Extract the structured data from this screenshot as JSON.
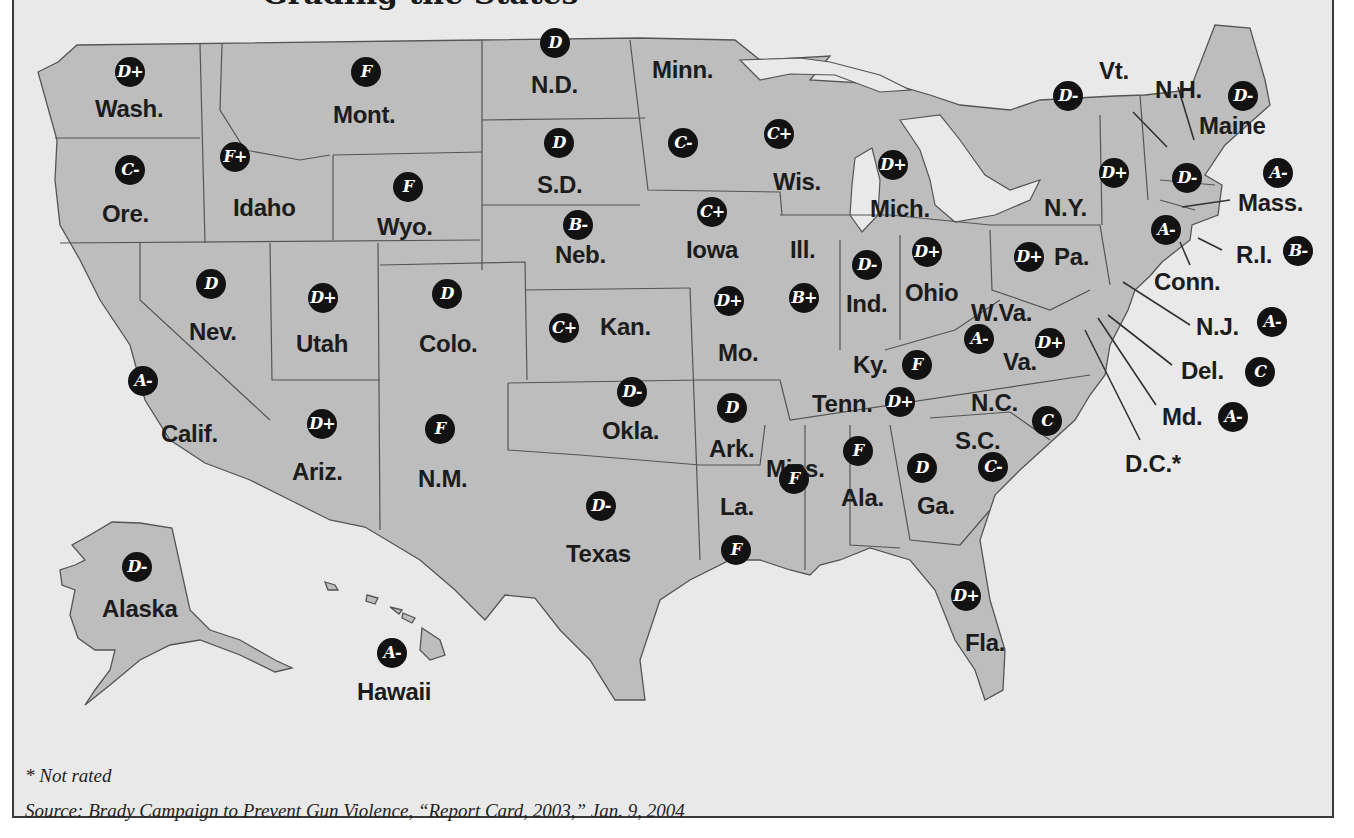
{
  "title": "Grading the States",
  "colors": {
    "background": "#e9e9e9",
    "land": "#bdbdbd",
    "badge": "#121212",
    "badge_text": "#ffffff",
    "border": "#3a3a3a"
  },
  "states": [
    {
      "abbr": "Wash.",
      "grade": "D+",
      "lx": 95,
      "ly": 95,
      "bx": 115,
      "by": 57
    },
    {
      "abbr": "Mont.",
      "grade": "F",
      "lx": 333,
      "ly": 101,
      "bx": 351,
      "by": 57
    },
    {
      "abbr": "N.D.",
      "grade": "D",
      "lx": 531,
      "ly": 71,
      "bx": 540,
      "by": 28
    },
    {
      "abbr": "Minn.",
      "grade": "",
      "lx": 652,
      "ly": 56,
      "bx": 0,
      "by": 0
    },
    {
      "abbr": "Minn. grade",
      "grade": "C-",
      "lx": 0,
      "ly": 0,
      "bx": 668,
      "by": 128
    },
    {
      "abbr": "Ore.",
      "grade": "C-",
      "lx": 102,
      "ly": 200,
      "bx": 115,
      "by": 155
    },
    {
      "abbr": "Idaho",
      "grade": "F+",
      "lx": 233,
      "ly": 194,
      "bx": 220,
      "by": 142
    },
    {
      "abbr": "Wyo.",
      "grade": "F",
      "lx": 377,
      "ly": 213,
      "bx": 393,
      "by": 172
    },
    {
      "abbr": "S.D.",
      "grade": "D",
      "lx": 537,
      "ly": 171,
      "bx": 544,
      "by": 128
    },
    {
      "abbr": "Neb.",
      "grade": "B-",
      "lx": 555,
      "ly": 241,
      "bx": 563,
      "by": 210
    },
    {
      "abbr": "Iowa",
      "grade": "C+",
      "lx": 686,
      "ly": 236,
      "bx": 697,
      "by": 197
    },
    {
      "abbr": "Wis.",
      "grade": "C+",
      "lx": 773,
      "ly": 168,
      "bx": 764,
      "by": 119
    },
    {
      "abbr": "Mich.",
      "grade": "D+",
      "lx": 870,
      "ly": 195,
      "bx": 878,
      "by": 150
    },
    {
      "abbr": "Vt.",
      "grade": "D-",
      "lx": 1099,
      "ly": 57,
      "bx": 1053,
      "by": 81
    },
    {
      "abbr": "N.H.",
      "grade": "D-",
      "lx": 1155,
      "ly": 76,
      "bx": 1172,
      "by": 163
    },
    {
      "abbr": "Maine",
      "grade": "D-",
      "lx": 1199,
      "ly": 112,
      "bx": 1228,
      "by": 81
    },
    {
      "abbr": "Mass.",
      "grade": "A-",
      "lx": 1238,
      "ly": 189,
      "bx": 1263,
      "by": 158
    },
    {
      "abbr": "N.Y.",
      "grade": "D+",
      "lx": 1044,
      "ly": 194,
      "bx": 1099,
      "by": 158
    },
    {
      "abbr": "Conn.",
      "grade": "A-",
      "lx": 1154,
      "ly": 268,
      "bx": 1151,
      "by": 215
    },
    {
      "abbr": "R.I.",
      "grade": "B-",
      "lx": 1236,
      "ly": 241,
      "bx": 1283,
      "by": 236
    },
    {
      "abbr": "Pa.",
      "grade": "D+",
      "lx": 1054,
      "ly": 243,
      "bx": 1014,
      "by": 242
    },
    {
      "abbr": "Ohio",
      "grade": "D+",
      "lx": 905,
      "ly": 279,
      "bx": 912,
      "by": 237
    },
    {
      "abbr": "Ind.",
      "grade": "D-",
      "lx": 846,
      "ly": 290,
      "bx": 852,
      "by": 250
    },
    {
      "abbr": "Ill.",
      "grade": "B+",
      "lx": 790,
      "ly": 236,
      "bx": 789,
      "by": 283
    },
    {
      "abbr": "Nev.",
      "grade": "D",
      "lx": 189,
      "ly": 318,
      "bx": 196,
      "by": 269
    },
    {
      "abbr": "Utah",
      "grade": "D+",
      "lx": 296,
      "ly": 330,
      "bx": 308,
      "by": 283
    },
    {
      "abbr": "Colo.",
      "grade": "D",
      "lx": 419,
      "ly": 330,
      "bx": 432,
      "by": 279
    },
    {
      "abbr": "Kan.",
      "grade": "C+",
      "lx": 600,
      "ly": 313,
      "bx": 549,
      "by": 313
    },
    {
      "abbr": "Mo.",
      "grade": "D+",
      "lx": 718,
      "ly": 339,
      "bx": 714,
      "by": 286
    },
    {
      "abbr": "W.Va.",
      "grade": "A-",
      "lx": 971,
      "ly": 299,
      "bx": 964,
      "by": 324
    },
    {
      "abbr": "Va.",
      "grade": "D+",
      "lx": 1003,
      "ly": 348,
      "bx": 1035,
      "by": 328
    },
    {
      "abbr": "Ky.",
      "grade": "F",
      "lx": 853,
      "ly": 351,
      "bx": 902,
      "by": 350
    },
    {
      "abbr": "N.J.",
      "grade": "A-",
      "lx": 1196,
      "ly": 313,
      "bx": 1257,
      "by": 307
    },
    {
      "abbr": "Del.",
      "grade": "C",
      "lx": 1181,
      "ly": 357,
      "bx": 1245,
      "by": 357
    },
    {
      "abbr": "Md.",
      "grade": "A-",
      "lx": 1162,
      "ly": 403,
      "bx": 1218,
      "by": 402
    },
    {
      "abbr": "D.C.*",
      "grade": "",
      "lx": 1125,
      "ly": 450,
      "bx": 0,
      "by": 0
    },
    {
      "abbr": "Calif.",
      "grade": "A-",
      "lx": 161,
      "ly": 420,
      "bx": 128,
      "by": 366
    },
    {
      "abbr": "Ariz.",
      "grade": "D+",
      "lx": 292,
      "ly": 458,
      "bx": 307,
      "by": 409
    },
    {
      "abbr": "N.M.",
      "grade": "F",
      "lx": 418,
      "ly": 465,
      "bx": 425,
      "by": 414
    },
    {
      "abbr": "Okla.",
      "grade": "D-",
      "lx": 602,
      "ly": 417,
      "bx": 617,
      "by": 377
    },
    {
      "abbr": "Ark.",
      "grade": "D",
      "lx": 709,
      "ly": 435,
      "bx": 717,
      "by": 393
    },
    {
      "abbr": "Tenn.",
      "grade": "D+",
      "lx": 812,
      "ly": 390,
      "bx": 885,
      "by": 387
    },
    {
      "abbr": "N.C.",
      "grade": "C",
      "lx": 971,
      "ly": 389,
      "bx": 1032,
      "by": 406
    },
    {
      "abbr": "S.C.",
      "grade": "C-",
      "lx": 955,
      "ly": 427,
      "bx": 978,
      "by": 452
    },
    {
      "abbr": "Miss.",
      "grade": "F",
      "lx": 766,
      "ly": 455,
      "bx": 779,
      "by": 464
    },
    {
      "abbr": "Ala.",
      "grade": "F",
      "lx": 841,
      "ly": 484,
      "bx": 843,
      "by": 436
    },
    {
      "abbr": "Ga.",
      "grade": "D",
      "lx": 917,
      "ly": 492,
      "bx": 907,
      "by": 453
    },
    {
      "abbr": "La.",
      "grade": "F",
      "lx": 720,
      "ly": 493,
      "bx": 721,
      "by": 535
    },
    {
      "abbr": "Texas",
      "grade": "D-",
      "lx": 566,
      "ly": 540,
      "bx": 586,
      "by": 491
    },
    {
      "abbr": "Fla.",
      "grade": "D+",
      "lx": 965,
      "ly": 629,
      "bx": 951,
      "by": 581
    },
    {
      "abbr": "Alaska",
      "grade": "D-",
      "lx": 102,
      "ly": 595,
      "bx": 122,
      "by": 552
    },
    {
      "abbr": "Hawaii",
      "grade": "A-",
      "lx": 357,
      "ly": 678,
      "bx": 377,
      "by": 638
    }
  ],
  "footnote": "* Not rated",
  "source": "Source: Brady Campaign to Prevent Gun Violence, “Report Card, 2003,” Jan. 9, 2004"
}
